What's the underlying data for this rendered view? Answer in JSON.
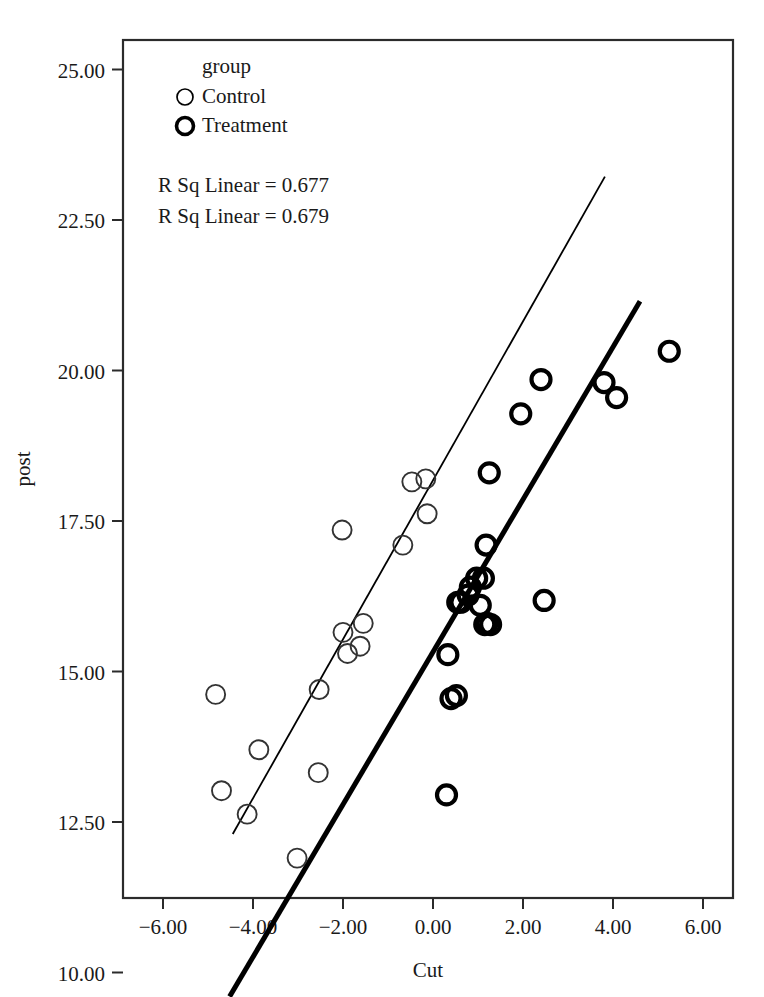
{
  "chart_data": {
    "type": "scatter",
    "title": "",
    "xlabel": "Cut",
    "ylabel": "post",
    "xlim": [
      -6.9,
      6.67
    ],
    "ylim": [
      9.55,
      25.8
    ],
    "xticks": [
      "-6.00",
      "-4.00",
      "-2.00",
      "0.00",
      "2.00",
      "4.00",
      "6.00"
    ],
    "xtick_values": [
      -6,
      -4,
      -2,
      0,
      2,
      4,
      6
    ],
    "yticks": [
      "25.00",
      "22.50",
      "20.00",
      "17.50",
      "15.00",
      "12.50",
      "10.00"
    ],
    "ytick_values": [
      25,
      22.5,
      20,
      17.5,
      15,
      12.5,
      10
    ],
    "grid": false,
    "legend_position": "top-left",
    "legend_title": "group",
    "annotations": [
      "R Sq Linear = 0.677",
      "R Sq Linear = 0.679"
    ],
    "series": [
      {
        "name": "Control",
        "marker": "open-circle-thin",
        "points": [
          [
            -4.83,
            14.62
          ],
          [
            -4.7,
            13.02
          ],
          [
            -4.13,
            12.63
          ],
          [
            -3.87,
            13.7
          ],
          [
            -3.02,
            11.9
          ],
          [
            -2.55,
            13.32
          ],
          [
            -2.53,
            14.7
          ],
          [
            -2.02,
            17.35
          ],
          [
            -2.0,
            15.65
          ],
          [
            -1.9,
            15.3
          ],
          [
            -1.62,
            15.42
          ],
          [
            -1.55,
            15.8
          ],
          [
            -0.67,
            17.1
          ],
          [
            -0.47,
            18.15
          ],
          [
            -0.16,
            18.2
          ],
          [
            -0.13,
            17.62
          ]
        ],
        "fit_line": {
          "x1": -4.45,
          "y1": 12.3,
          "x2": 3.82,
          "y2": 23.22,
          "r_squared": 0.677,
          "weight": "thin"
        }
      },
      {
        "name": "Treatment",
        "marker": "open-circle-thick",
        "points": [
          [
            0.3,
            12.95
          ],
          [
            0.33,
            15.28
          ],
          [
            0.4,
            14.55
          ],
          [
            0.52,
            14.6
          ],
          [
            0.55,
            16.15
          ],
          [
            0.62,
            16.15
          ],
          [
            0.78,
            16.27
          ],
          [
            0.83,
            16.4
          ],
          [
            0.97,
            16.55
          ],
          [
            1.05,
            16.1
          ],
          [
            1.12,
            16.55
          ],
          [
            1.15,
            15.78
          ],
          [
            1.18,
            17.1
          ],
          [
            1.2,
            15.8
          ],
          [
            1.28,
            15.78
          ],
          [
            1.25,
            18.3
          ],
          [
            1.95,
            19.28
          ],
          [
            2.4,
            19.85
          ],
          [
            2.47,
            16.18
          ],
          [
            3.8,
            19.8
          ],
          [
            4.08,
            19.55
          ],
          [
            5.25,
            20.32
          ]
        ],
        "fit_line": {
          "x1": -4.52,
          "y1": 9.6,
          "x2": 4.6,
          "y2": 21.15,
          "r_squared": 0.679,
          "weight": "thick"
        }
      }
    ]
  },
  "legend": {
    "title": "group",
    "entries": [
      {
        "label": "Control",
        "marker": "open-circle-thin"
      },
      {
        "label": "Treatment",
        "marker": "open-circle-thick"
      }
    ]
  },
  "annotations": {
    "rsq_control": "R Sq Linear = 0.677",
    "rsq_treatment": "R Sq Linear = 0.679"
  },
  "axes": {
    "x_title": "Cut",
    "y_title": "post",
    "x_tick_labels": [
      "-6.00",
      "-4.00",
      "-2.00",
      "0.00",
      "2.00",
      "4.00",
      "6.00"
    ],
    "y_tick_labels": [
      "25.00",
      "22.50",
      "20.00",
      "17.50",
      "15.00",
      "12.50",
      "10.00"
    ]
  },
  "colors": {
    "foreground": "#1a1a1a",
    "frame": "#2b2b2b",
    "background": "#ffffff",
    "control_marker": "#333333",
    "treatment_marker": "#000000"
  }
}
